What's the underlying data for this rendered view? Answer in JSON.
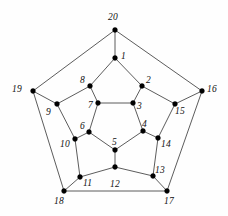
{
  "figure": {
    "background_color": "#fefefe",
    "edge_color": "#4a4a4a",
    "vertex_color": "#000000",
    "width": 228,
    "height": 216
  },
  "chart_data": {
    "type": "diagram",
    "title": "",
    "subtitle": "",
    "xlabel": "",
    "ylabel": "",
    "grid": false,
    "legend": null,
    "graph_kind": "dodecahedral-graph",
    "vertex_count": 20,
    "edge_count": 30,
    "nodes": [
      {
        "id": 1,
        "label": "1",
        "x": 115,
        "y": 58,
        "lx": 121,
        "ly": 52
      },
      {
        "id": 2,
        "label": "2",
        "x": 142,
        "y": 86,
        "lx": 146,
        "ly": 76
      },
      {
        "id": 3,
        "label": "3",
        "x": 133,
        "y": 103,
        "lx": 137,
        "ly": 102
      },
      {
        "id": 4,
        "label": "4",
        "x": 143,
        "y": 131,
        "lx": 142,
        "ly": 120
      },
      {
        "id": 5,
        "label": "5",
        "x": 115,
        "y": 150,
        "lx": 112,
        "ly": 138
      },
      {
        "id": 6,
        "label": "6",
        "x": 89,
        "y": 132,
        "lx": 80,
        "ly": 122
      },
      {
        "id": 7,
        "label": "7",
        "x": 98,
        "y": 103,
        "lx": 88,
        "ly": 101
      },
      {
        "id": 8,
        "label": "8",
        "x": 90,
        "y": 86,
        "lx": 80,
        "ly": 76
      },
      {
        "id": 9,
        "label": "9",
        "x": 57,
        "y": 104,
        "lx": 46,
        "ly": 108
      },
      {
        "id": 10,
        "label": "10",
        "x": 75,
        "y": 139,
        "lx": 60,
        "ly": 140
      },
      {
        "id": 11,
        "label": "11",
        "x": 80,
        "y": 177,
        "lx": 83,
        "ly": 179
      },
      {
        "id": 12,
        "label": "12",
        "x": 115,
        "y": 167,
        "lx": 110,
        "ly": 180
      },
      {
        "id": 13,
        "label": "13",
        "x": 153,
        "y": 176,
        "lx": 155,
        "ly": 166
      },
      {
        "id": 14,
        "label": "14",
        "x": 158,
        "y": 138,
        "lx": 161,
        "ly": 140
      },
      {
        "id": 15,
        "label": "15",
        "x": 175,
        "y": 104,
        "lx": 175,
        "ly": 107
      },
      {
        "id": 16,
        "label": "16",
        "x": 202,
        "y": 91,
        "lx": 207,
        "ly": 85
      },
      {
        "id": 17,
        "label": "17",
        "x": 167,
        "y": 191,
        "lx": 164,
        "ly": 197
      },
      {
        "id": 18,
        "label": "18",
        "x": 64,
        "y": 191,
        "lx": 54,
        "ly": 197
      },
      {
        "id": 19,
        "label": "19",
        "x": 33,
        "y": 91,
        "lx": 12,
        "ly": 85
      },
      {
        "id": 20,
        "label": "20",
        "x": 115,
        "y": 30,
        "lx": 108,
        "ly": 13
      }
    ],
    "edges": [
      [
        1,
        20
      ],
      [
        1,
        2
      ],
      [
        1,
        8
      ],
      [
        2,
        3
      ],
      [
        2,
        15
      ],
      [
        3,
        4
      ],
      [
        3,
        7
      ],
      [
        4,
        5
      ],
      [
        4,
        14
      ],
      [
        5,
        6
      ],
      [
        5,
        12
      ],
      [
        6,
        7
      ],
      [
        6,
        10
      ],
      [
        7,
        8
      ],
      [
        8,
        9
      ],
      [
        9,
        10
      ],
      [
        9,
        19
      ],
      [
        10,
        11
      ],
      [
        11,
        12
      ],
      [
        11,
        18
      ],
      [
        12,
        13
      ],
      [
        13,
        14
      ],
      [
        13,
        17
      ],
      [
        14,
        15
      ],
      [
        15,
        16
      ],
      [
        16,
        17
      ],
      [
        16,
        20
      ],
      [
        17,
        18
      ],
      [
        18,
        19
      ],
      [
        19,
        20
      ]
    ]
  }
}
